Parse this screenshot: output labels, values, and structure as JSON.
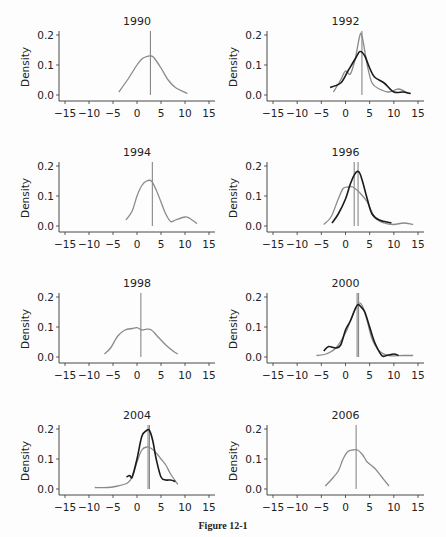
{
  "figure": {
    "caption": "Figure 12-1"
  },
  "colors": {
    "gray_line": "#8a8a8a",
    "black_line": "#1a1a1a",
    "axis": "#333333",
    "marker": "#888888"
  },
  "axes_common": {
    "ylabel": "Density",
    "xticks": [
      -15,
      -10,
      -5,
      0,
      5,
      10,
      15
    ],
    "yticks": [
      "0.0",
      "0.1",
      "0.2"
    ],
    "xlim": [
      -15,
      15
    ],
    "ylim": [
      0,
      0.2
    ]
  },
  "chart_data": [
    {
      "type": "line",
      "title": "1990",
      "xlabel": "",
      "ylabel": "Density",
      "xlim": [
        -15,
        15
      ],
      "ylim": [
        0,
        0.2
      ],
      "markers": [
        2.8
      ],
      "series": [
        {
          "name": "gray",
          "color": "gray",
          "x": [
            -3.8,
            -2,
            0,
            1,
            2,
            2.8,
            3.5,
            5,
            6.5,
            8,
            10.5
          ],
          "y": [
            0.01,
            0.05,
            0.1,
            0.12,
            0.128,
            0.13,
            0.125,
            0.09,
            0.05,
            0.025,
            0.005
          ]
        }
      ]
    },
    {
      "type": "line",
      "title": "1992",
      "xlabel": "",
      "ylabel": "Density",
      "xlim": [
        -15,
        15
      ],
      "ylim": [
        0,
        0.2
      ],
      "markers": [
        3.4
      ],
      "series": [
        {
          "name": "gray",
          "color": "gray",
          "x": [
            -2.5,
            -1,
            0,
            1,
            2,
            3,
            3.5,
            4.5,
            5.5,
            7,
            9,
            11,
            13
          ],
          "y": [
            0.01,
            0.05,
            0.08,
            0.07,
            0.12,
            0.2,
            0.19,
            0.1,
            0.04,
            0.02,
            0.01,
            0.02,
            0.005
          ]
        },
        {
          "name": "black",
          "color": "black",
          "x": [
            -3.2,
            -1,
            0.5,
            2,
            3,
            4,
            5,
            6,
            8,
            10,
            12,
            13.5
          ],
          "y": [
            0.025,
            0.04,
            0.08,
            0.12,
            0.145,
            0.13,
            0.09,
            0.06,
            0.04,
            0.01,
            0.01,
            0.005
          ]
        }
      ]
    },
    {
      "type": "line",
      "title": "1994",
      "xlabel": "",
      "ylabel": "Density",
      "xlim": [
        -15,
        15
      ],
      "ylim": [
        0,
        0.2
      ],
      "markers": [
        3.2
      ],
      "series": [
        {
          "name": "gray",
          "color": "gray",
          "x": [
            -2.3,
            -1,
            0,
            1,
            2,
            3,
            4,
            5,
            6,
            7,
            8,
            10,
            11,
            12.5
          ],
          "y": [
            0.02,
            0.05,
            0.1,
            0.135,
            0.15,
            0.15,
            0.12,
            0.08,
            0.04,
            0.015,
            0.02,
            0.03,
            0.025,
            0.008
          ]
        }
      ]
    },
    {
      "type": "line",
      "title": "1996",
      "xlabel": "",
      "ylabel": "Density",
      "xlim": [
        -15,
        15
      ],
      "ylim": [
        0,
        0.2
      ],
      "markers": [
        1.8,
        2.6
      ],
      "series": [
        {
          "name": "gray",
          "color": "gray",
          "x": [
            -4.5,
            -3,
            -1.5,
            -0.5,
            0.5,
            1.5,
            3,
            4.5,
            6,
            8,
            10,
            12,
            14
          ],
          "y": [
            0.005,
            0.03,
            0.09,
            0.125,
            0.13,
            0.13,
            0.11,
            0.08,
            0.03,
            0.01,
            0.005,
            0.01,
            0.005
          ]
        },
        {
          "name": "black",
          "color": "black",
          "x": [
            -2.8,
            -1.5,
            0,
            1,
            2,
            2.8,
            3.5,
            4.5,
            5.5,
            7,
            9.5
          ],
          "y": [
            0.01,
            0.04,
            0.09,
            0.14,
            0.175,
            0.18,
            0.15,
            0.09,
            0.04,
            0.02,
            0.01
          ]
        }
      ]
    },
    {
      "type": "line",
      "title": "1998",
      "xlabel": "",
      "ylabel": "Density",
      "xlim": [
        -15,
        15
      ],
      "ylim": [
        0,
        0.2
      ],
      "markers": [
        0.8
      ],
      "series": [
        {
          "name": "gray",
          "color": "gray",
          "x": [
            -6.8,
            -5.5,
            -4,
            -2.5,
            -1,
            0,
            1,
            2,
            3,
            4.5,
            6,
            7.5,
            8.5
          ],
          "y": [
            0.01,
            0.03,
            0.07,
            0.09,
            0.095,
            0.098,
            0.09,
            0.093,
            0.09,
            0.065,
            0.04,
            0.02,
            0.01
          ]
        }
      ]
    },
    {
      "type": "line",
      "title": "2000",
      "xlabel": "",
      "ylabel": "Density",
      "xlim": [
        -15,
        15
      ],
      "ylim": [
        0,
        0.2
      ],
      "markers": [
        2.4,
        2.7
      ],
      "series": [
        {
          "name": "gray",
          "color": "gray",
          "x": [
            -6,
            -4,
            -2,
            0,
            1,
            2,
            2.8,
            3.5,
            4.5,
            5.5,
            7,
            9,
            12,
            14
          ],
          "y": [
            0.005,
            0.01,
            0.03,
            0.08,
            0.12,
            0.16,
            0.18,
            0.17,
            0.12,
            0.06,
            0.02,
            0.005,
            0.005,
            0.005
          ]
        },
        {
          "name": "black",
          "color": "black",
          "x": [
            -4.5,
            -3.5,
            -2,
            -1,
            0,
            1,
            2,
            2.6,
            3.3,
            4,
            5,
            6,
            7.5,
            8.5,
            10,
            11
          ],
          "y": [
            0.02,
            0.035,
            0.03,
            0.04,
            0.09,
            0.12,
            0.16,
            0.175,
            0.165,
            0.15,
            0.1,
            0.05,
            0.005,
            0.005,
            0.01,
            0.005
          ]
        }
      ]
    },
    {
      "type": "line",
      "title": "2004",
      "xlabel": "",
      "ylabel": "Density",
      "xlim": [
        -15,
        15
      ],
      "ylim": [
        0,
        0.2
      ],
      "markers": [
        2.3,
        2.6
      ],
      "series": [
        {
          "name": "gray",
          "color": "gray",
          "x": [
            -8.8,
            -6,
            -4,
            -2,
            -1,
            0,
            1,
            2,
            3,
            4,
            5,
            6,
            7,
            8.5
          ],
          "y": [
            0.005,
            0.005,
            0.01,
            0.02,
            0.04,
            0.09,
            0.13,
            0.14,
            0.135,
            0.12,
            0.1,
            0.08,
            0.05,
            0.015
          ]
        },
        {
          "name": "black",
          "color": "black",
          "x": [
            -2.2,
            -1.5,
            -1,
            0,
            1,
            2,
            2.6,
            3.3,
            4,
            5,
            6,
            7,
            8
          ],
          "y": [
            0.04,
            0.045,
            0.04,
            0.1,
            0.175,
            0.195,
            0.195,
            0.16,
            0.1,
            0.04,
            0.03,
            0.03,
            0.025
          ]
        }
      ]
    },
    {
      "type": "line",
      "title": "2006",
      "xlabel": "",
      "ylabel": "Density",
      "xlim": [
        -15,
        15
      ],
      "ylim": [
        0,
        0.2
      ],
      "markers": [
        2.2
      ],
      "series": [
        {
          "name": "gray",
          "color": "gray",
          "x": [
            -4.2,
            -3,
            -1.5,
            -0.5,
            0.5,
            1.5,
            2.5,
            3.5,
            4.5,
            6,
            7.5,
            9
          ],
          "y": [
            0.01,
            0.03,
            0.06,
            0.1,
            0.125,
            0.13,
            0.13,
            0.115,
            0.09,
            0.07,
            0.04,
            0.01
          ]
        }
      ]
    }
  ]
}
